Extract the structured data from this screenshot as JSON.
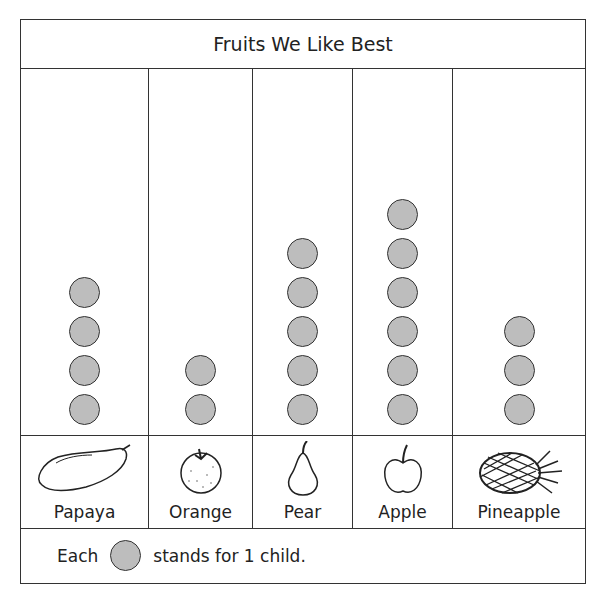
{
  "chart_data": {
    "type": "pictograph",
    "title": "Fruits We Like Best",
    "categories": [
      "Papaya",
      "Orange",
      "Pear",
      "Apple",
      "Pineapple"
    ],
    "values": [
      4,
      2,
      5,
      6,
      3
    ],
    "unit": "child",
    "key": "Each circle stands for 1 child.",
    "symbol_color": "#bdbdbd"
  },
  "title": "Fruits We Like Best",
  "columns": [
    {
      "label": "Papaya",
      "count": 4,
      "icon": "papaya-icon"
    },
    {
      "label": "Orange",
      "count": 2,
      "icon": "orange-icon"
    },
    {
      "label": "Pear",
      "count": 5,
      "icon": "pear-icon"
    },
    {
      "label": "Apple",
      "count": 6,
      "icon": "apple-icon"
    },
    {
      "label": "Pineapple",
      "count": 3,
      "icon": "pineapple-icon"
    }
  ],
  "key": {
    "prefix": "Each",
    "suffix": "stands for 1 child."
  }
}
